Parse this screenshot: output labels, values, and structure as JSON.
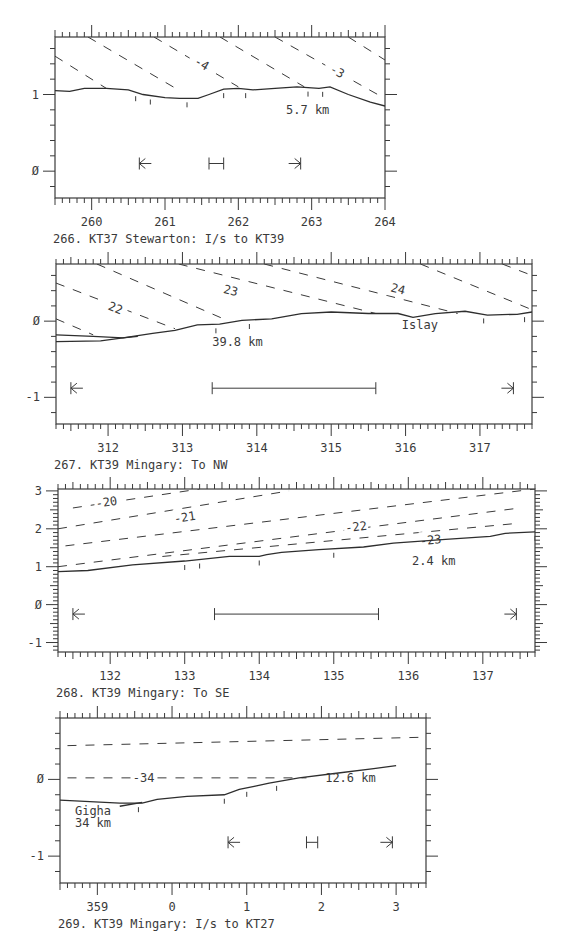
{
  "figure": {
    "background": "#ffffff",
    "ink": "#3a3a3a"
  },
  "chart_data": [
    {
      "type": "line",
      "id": "266",
      "title": "266. KT37 Stewarton: I/s to KT39",
      "xlabel": "",
      "ylabel": "",
      "xlim": [
        259.5,
        264.0
      ],
      "ylim": [
        -0.35,
        1.75
      ],
      "xticks": [
        260,
        261,
        262,
        263,
        264
      ],
      "yticks": [
        0,
        1
      ],
      "ytick_labels": [
        "0",
        "1"
      ],
      "grid": false,
      "frame": {
        "x": 55,
        "y": 37,
        "w": 330,
        "h": 161
      },
      "series": [
        {
          "name": "terrain profile",
          "style": "solid",
          "x": [
            259.5,
            259.7,
            259.9,
            260.2,
            260.5,
            260.7,
            261.0,
            261.2,
            261.45,
            261.6,
            261.8,
            262.0,
            262.2,
            262.5,
            262.8,
            262.95,
            263.1,
            263.25,
            263.5,
            263.8,
            264.0
          ],
          "y": [
            1.05,
            1.04,
            1.08,
            1.08,
            1.06,
            1.0,
            0.96,
            0.95,
            0.95,
            1.0,
            1.07,
            1.08,
            1.06,
            1.08,
            1.1,
            1.09,
            1.08,
            1.1,
            1.0,
            0.9,
            0.85
          ]
        }
      ],
      "contours": [
        {
          "label": "",
          "x": [
            259.5,
            260.2
          ],
          "y": [
            1.5,
            1.08
          ]
        },
        {
          "label": "",
          "x": [
            259.95,
            261.2
          ],
          "y": [
            1.75,
            1.05
          ]
        },
        {
          "label": "-4",
          "x": [
            260.85,
            262.0
          ],
          "y": [
            1.75,
            1.1
          ],
          "label_x": 261.5,
          "label_y": 1.4
        },
        {
          "label": "",
          "x": [
            261.75,
            262.9
          ],
          "y": [
            1.75,
            1.1
          ]
        },
        {
          "label": "-3",
          "x": [
            262.5,
            263.9
          ],
          "y": [
            1.75,
            1.0
          ],
          "label_x": 263.35,
          "label_y": 1.3
        },
        {
          "label": "",
          "x": [
            263.5,
            264.0
          ],
          "y": [
            1.75,
            1.45
          ]
        }
      ],
      "site_ticks_x": [
        260.6,
        260.8,
        261.3,
        261.8,
        262.1,
        262.95,
        263.15
      ],
      "annotations": [
        {
          "text": "5.7 km",
          "x": 262.65,
          "y": 0.75
        }
      ],
      "markers": {
        "left_arrow_x": 260.65,
        "range_x": [
          261.6,
          261.8
        ],
        "right_arrow_x": 262.85,
        "y": 0.1
      }
    },
    {
      "type": "line",
      "id": "267",
      "title": "267. KT39 Mingary: To NW",
      "xlabel": "",
      "ylabel": "",
      "xlim": [
        311.3,
        317.7
      ],
      "ylim": [
        -1.35,
        0.75
      ],
      "xticks": [
        312,
        313,
        314,
        315,
        316,
        317
      ],
      "yticks": [
        -1,
        0
      ],
      "ytick_labels": [
        "-1",
        "0"
      ],
      "grid": false,
      "frame": {
        "x": 56,
        "y": 264,
        "w": 476,
        "h": 160
      },
      "series": [
        {
          "name": "terrain profile (far)",
          "style": "solid",
          "x": [
            311.3,
            311.8,
            312.2,
            312.4
          ],
          "y": [
            -0.18,
            -0.2,
            -0.22,
            -0.2
          ]
        },
        {
          "name": "terrain profile",
          "style": "solid",
          "x": [
            311.3,
            311.9,
            312.2,
            312.6,
            312.9,
            313.2,
            313.5,
            313.8,
            314.2,
            314.6,
            315.0,
            315.5,
            315.9,
            316.1,
            316.4,
            316.8,
            317.1,
            317.5,
            317.7
          ],
          "y": [
            -0.27,
            -0.26,
            -0.22,
            -0.16,
            -0.12,
            -0.05,
            -0.04,
            0.01,
            0.03,
            0.1,
            0.12,
            0.1,
            0.1,
            0.05,
            0.1,
            0.13,
            0.08,
            0.09,
            0.12
          ]
        }
      ],
      "contours": [
        {
          "label": "",
          "x": [
            311.3,
            311.8
          ],
          "y": [
            0.03,
            -0.18
          ]
        },
        {
          "label": "22",
          "x": [
            311.3,
            312.9
          ],
          "y": [
            0.5,
            -0.1
          ],
          "label_x": 312.1,
          "label_y": 0.17
        },
        {
          "label": "",
          "x": [
            311.85,
            313.6
          ],
          "y": [
            0.75,
            0.01
          ]
        },
        {
          "label": "23",
          "x": [
            312.95,
            315.6
          ],
          "y": [
            0.75,
            0.1
          ],
          "label_x": 313.65,
          "label_y": 0.4
        },
        {
          "label": "24",
          "x": [
            314.1,
            316.7
          ],
          "y": [
            0.75,
            0.1
          ],
          "label_x": 315.9,
          "label_y": 0.42
        },
        {
          "label": "",
          "x": [
            316.2,
            317.7
          ],
          "y": [
            0.75,
            0.15
          ]
        },
        {
          "label": "",
          "x": [
            317.3,
            317.7
          ],
          "y": [
            0.75,
            0.6
          ]
        }
      ],
      "site_ticks_x": [
        313.45,
        313.9,
        317.05,
        317.6
      ],
      "annotations": [
        {
          "text": "39.8 km",
          "x": 313.4,
          "y": -0.33
        },
        {
          "text": "Islay",
          "x": 315.95,
          "y": -0.1
        }
      ],
      "markers": {
        "left_arrow_x": 311.5,
        "range_x": [
          313.4,
          315.6
        ],
        "right_arrow_x": 317.45,
        "y": -0.88
      }
    },
    {
      "type": "line",
      "id": "268",
      "title": "268. KT39 Mingary: To SE",
      "xlabel": "",
      "ylabel": "",
      "xlim": [
        131.3,
        137.7
      ],
      "ylim": [
        -1.25,
        3.05
      ],
      "xticks": [
        132,
        133,
        134,
        135,
        136,
        137
      ],
      "yticks": [
        -1,
        0,
        1,
        2,
        3
      ],
      "ytick_labels": [
        "-1",
        "0",
        "1",
        "2",
        "3"
      ],
      "grid": false,
      "frame": {
        "x": 58,
        "y": 489,
        "w": 477,
        "h": 163
      },
      "series": [
        {
          "name": "terrain profile",
          "style": "solid",
          "x": [
            131.3,
            131.7,
            132.3,
            133.0,
            133.6,
            134.0,
            134.1,
            134.3,
            134.8,
            135.4,
            135.8,
            136.5,
            137.1,
            137.3,
            137.7
          ],
          "y": [
            0.87,
            0.9,
            1.05,
            1.15,
            1.27,
            1.27,
            1.32,
            1.38,
            1.45,
            1.52,
            1.62,
            1.72,
            1.8,
            1.88,
            1.92
          ]
        }
      ],
      "contours": [
        {
          "label": "-20",
          "x": [
            131.5,
            133.2
          ],
          "y": [
            2.55,
            3.05
          ],
          "label_x": 131.95,
          "label_y": 2.7
        },
        {
          "label": "-21",
          "x": [
            131.3,
            134.4
          ],
          "y": [
            2.0,
            3.0
          ],
          "label_x": 133.0,
          "label_y": 2.3
        },
        {
          "label": "",
          "x": [
            131.4,
            137.7
          ],
          "y": [
            1.55,
            3.05
          ]
        },
        {
          "label": "-22",
          "x": [
            131.3,
            137.5
          ],
          "y": [
            1.0,
            2.55
          ],
          "label_x": 135.3,
          "label_y": 2.05
        },
        {
          "label": "-23",
          "x": [
            132.7,
            137.5
          ],
          "y": [
            1.27,
            2.15
          ],
          "label_x": 136.3,
          "label_y": 1.7
        }
      ],
      "site_ticks_x": [
        133.0,
        133.2,
        134.0,
        135.0,
        137.7
      ],
      "annotations": [
        {
          "text": "2.4 km",
          "x": 136.05,
          "y": 1.05
        }
      ],
      "markers": {
        "left_arrow_x": 131.5,
        "range_x": [
          133.4,
          135.6
        ],
        "right_arrow_x": 137.45,
        "y": -0.25
      }
    },
    {
      "type": "line",
      "id": "269",
      "title": "269. KT39 Mingary: I/s to KT27",
      "xlabel": "",
      "ylabel": "",
      "xlim": [
        358.5,
        3.4
      ],
      "x_continuous": [
        -1.5,
        3.4
      ],
      "ylim": [
        -1.35,
        0.8
      ],
      "xticks": [
        -1,
        0,
        1,
        2,
        3
      ],
      "xtick_labels": [
        "359",
        "0",
        "1",
        "2",
        "3"
      ],
      "yticks": [
        -1,
        0
      ],
      "ytick_labels": [
        "-1",
        "0"
      ],
      "grid": false,
      "frame": {
        "x": 60,
        "y": 718,
        "w": 366,
        "h": 165
      },
      "series": [
        {
          "name": "terrain profile",
          "style": "solid",
          "x": [
            -1.5,
            -1.1,
            -0.7,
            -0.4,
            -0.2,
            0.2,
            0.7,
            0.9,
            1.1,
            1.3,
            1.7,
            2.2,
            2.7,
            3.0
          ],
          "y": [
            -0.27,
            -0.29,
            -0.31,
            -0.31,
            -0.26,
            -0.22,
            -0.2,
            -0.13,
            -0.09,
            -0.05,
            0.02,
            0.08,
            0.14,
            0.18
          ]
        },
        {
          "name": "terrain profile (near)",
          "style": "solid",
          "x": [
            -0.7,
            -0.4
          ],
          "y": [
            -0.35,
            -0.3
          ]
        }
      ],
      "contours": [
        {
          "label": "",
          "x": [
            -1.4,
            3.4
          ],
          "y": [
            0.44,
            0.55
          ]
        },
        {
          "label": "-34",
          "x": [
            -1.4,
            1.8
          ],
          "y": [
            0.02,
            0.02
          ],
          "label_x": -0.38,
          "label_y": 0.02
        }
      ],
      "site_ticks_x": [
        -0.45,
        0.7,
        1.0,
        1.4
      ],
      "annotations": [
        {
          "text": "12.6 km",
          "x": 2.05,
          "y": -0.03
        },
        {
          "text": "Gigha",
          "x": -1.3,
          "y": -0.47
        },
        {
          "text": "34 km",
          "x": -1.3,
          "y": -0.62
        }
      ],
      "markers": {
        "left_arrow_x": 0.75,
        "range_x": [
          1.8,
          1.95
        ],
        "right_arrow_x": 2.95,
        "y": -0.82
      }
    }
  ]
}
